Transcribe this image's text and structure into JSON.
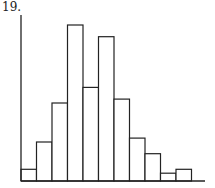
{
  "problem_label": "19.",
  "chart_data": {
    "type": "bar",
    "subtype": "histogram",
    "title": "",
    "xlabel": "",
    "ylabel": "",
    "categories": [
      "1",
      "2",
      "3",
      "4",
      "5",
      "6",
      "7",
      "8",
      "9",
      "10",
      "11"
    ],
    "values": [
      3,
      10,
      20,
      40,
      24,
      37,
      21,
      11,
      7,
      2,
      3
    ],
    "grid": false,
    "legend": null,
    "ylim": [
      0,
      42
    ]
  }
}
